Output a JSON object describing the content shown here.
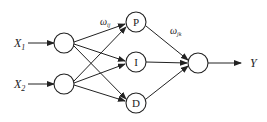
{
  "diagram": {
    "type": "neural-network-pid",
    "inputs": [
      {
        "label": "X",
        "sub": "1"
      },
      {
        "label": "X",
        "sub": "2"
      }
    ],
    "hidden": [
      {
        "label": "P"
      },
      {
        "label": "I"
      },
      {
        "label": "D"
      }
    ],
    "output": {
      "label": "Y"
    },
    "weights": {
      "input_hidden": {
        "sym": "ω",
        "sub": "ij"
      },
      "hidden_output": {
        "sym": "ω",
        "sub": "jk"
      }
    },
    "colors": {
      "stroke": "#222222",
      "background": "#ffffff"
    }
  }
}
